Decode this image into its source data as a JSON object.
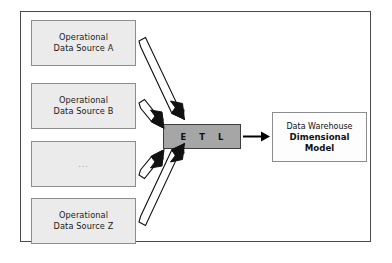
{
  "diagram": {
    "title_text": "",
    "frame": {
      "border_color": "#4a4a4a",
      "background": "#ffffff"
    },
    "sources": [
      {
        "id": "source-a",
        "line1": "Operational",
        "line2": "Data Source A",
        "fill": "#ebebeb",
        "border": "#8d8d8d"
      },
      {
        "id": "source-b",
        "line1": "Operational",
        "line2": "Data Source B",
        "fill": "#ebebeb",
        "border": "#8d8d8d"
      },
      {
        "id": "source-ellipsis",
        "line1": "...",
        "line2": "",
        "fill": "#ebebeb",
        "border": "#8d8d8d"
      },
      {
        "id": "source-z",
        "line1": "Operational",
        "line2": "Data Source Z",
        "fill": "#ebebeb",
        "border": "#8d8d8d"
      }
    ],
    "etl": {
      "letters": [
        "E",
        "T",
        "L"
      ],
      "fill": "#a6a6a6",
      "border": "#3d3d3d"
    },
    "warehouse": {
      "line1": "Data Warehouse",
      "line2": "Dimensional",
      "line3": "Model",
      "fill": "#fdfdfd",
      "border": "#8d8d8d"
    },
    "arrows": {
      "hollow_outline_color": "#111111",
      "solid_color": "#000000",
      "count_hollow": 4,
      "count_solid": 1
    }
  }
}
